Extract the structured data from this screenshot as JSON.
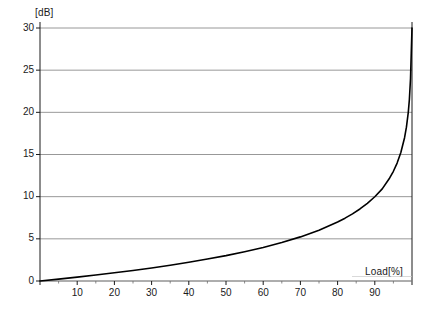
{
  "chart_data": {
    "type": "line",
    "title": "",
    "xlabel": "Load[%]",
    "ylabel": "[dB]",
    "xlim": [
      0,
      100
    ],
    "ylim": [
      0,
      30
    ],
    "grid": true,
    "legend": null,
    "y_ticks": [
      0,
      5,
      10,
      15,
      20,
      25,
      30
    ],
    "y_tick_labels": [
      "0",
      "5",
      "10",
      "15",
      "20",
      "25",
      "30"
    ],
    "x_ticks": [
      10,
      20,
      30,
      40,
      50,
      60,
      70,
      80,
      90
    ],
    "x_tick_labels": [
      "10",
      "20",
      "30",
      "40",
      "50",
      "60",
      "70",
      "80",
      "90"
    ],
    "x_minor_ticks": [
      5,
      15,
      25,
      35,
      45,
      55,
      65,
      75,
      85,
      95
    ],
    "series": [
      {
        "name": "noise-rise",
        "color": "#000000",
        "x": [
          0,
          5,
          10,
          15,
          20,
          25,
          30,
          35,
          40,
          45,
          50,
          55,
          60,
          65,
          70,
          75,
          80,
          82,
          84,
          86,
          88,
          90,
          92,
          94,
          95,
          96,
          97,
          98,
          98.5,
          99,
          99.3,
          99.6,
          99.8
        ],
        "y": [
          0.0,
          0.22,
          0.46,
          0.71,
          0.97,
          1.25,
          1.55,
          1.87,
          2.22,
          2.6,
          3.01,
          3.47,
          3.98,
          4.56,
          5.23,
          6.02,
          6.99,
          7.45,
          7.96,
          8.54,
          9.21,
          9.99,
          10.92,
          12.22,
          13.01,
          13.98,
          15.23,
          16.99,
          18.24,
          20.0,
          21.55,
          23.98,
          26.99
        ]
      }
    ]
  },
  "labels": {
    "y_unit": "[dB]",
    "x_unit": "Load[%]"
  },
  "footer": {
    "cut_text": ""
  }
}
